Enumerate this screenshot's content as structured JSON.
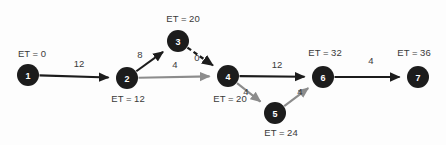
{
  "diagram": {
    "background_color": "#fdfdfd",
    "node_fill": "#1c1c1c",
    "node_text_color": "#ffffff",
    "critical_edge_color": "#1c1c1c",
    "noncritical_edge_color": "#8c8c8c",
    "label_color": "#3a3a3a",
    "node_radius": 11
  },
  "nodes": [
    {
      "id": "1",
      "label": "1",
      "cx": 28,
      "cy": 75,
      "et_text": "ET = 0",
      "et_x": 32,
      "et_y": 53
    },
    {
      "id": "2",
      "label": "2",
      "cx": 127,
      "cy": 78,
      "et_text": "ET = 12",
      "et_x": 128,
      "et_y": 98
    },
    {
      "id": "3",
      "label": "3",
      "cx": 178,
      "cy": 41,
      "et_text": "ET = 20",
      "et_x": 183,
      "et_y": 18
    },
    {
      "id": "4",
      "label": "4",
      "cx": 228,
      "cy": 76,
      "et_text": "ET = 20",
      "et_x": 230,
      "et_y": 98
    },
    {
      "id": "5",
      "label": "5",
      "cx": 275,
      "cy": 113,
      "et_text": "ET = 24",
      "et_x": 281,
      "et_y": 132
    },
    {
      "id": "6",
      "label": "6",
      "cx": 323,
      "cy": 77,
      "et_text": "ET = 32",
      "et_x": 325,
      "et_y": 52
    },
    {
      "id": "7",
      "label": "7",
      "cx": 418,
      "cy": 77,
      "et_text": "ET = 36",
      "et_x": 414,
      "et_y": 52
    }
  ],
  "edges": [
    {
      "id": "e1-2",
      "from": "1",
      "to": "2",
      "weight": "12",
      "style": "solid",
      "color": "critical",
      "label_x": 79,
      "label_y": 63
    },
    {
      "id": "e2-3",
      "from": "2",
      "to": "3",
      "weight": "8",
      "style": "solid",
      "color": "critical",
      "label_x": 140,
      "label_y": 54
    },
    {
      "id": "e3-4",
      "from": "3",
      "to": "4",
      "weight": "0",
      "style": "dashed",
      "color": "critical",
      "label_x": 197,
      "label_y": 57
    },
    {
      "id": "e2-4",
      "from": "2",
      "to": "4",
      "weight": "4",
      "style": "solid",
      "color": "noncritical",
      "label_x": 175,
      "label_y": 64
    },
    {
      "id": "e4-6",
      "from": "4",
      "to": "6",
      "weight": "12",
      "style": "solid",
      "color": "critical",
      "label_x": 277,
      "label_y": 64
    },
    {
      "id": "e4-5",
      "from": "4",
      "to": "5",
      "weight": "4",
      "style": "solid",
      "color": "noncritical",
      "label_x": 246,
      "label_y": 91
    },
    {
      "id": "e5-6",
      "from": "5",
      "to": "6",
      "weight": "4",
      "style": "solid",
      "color": "noncritical",
      "label_x": 300,
      "label_y": 91
    },
    {
      "id": "e6-7",
      "from": "6",
      "to": "7",
      "weight": "4",
      "style": "solid",
      "color": "critical",
      "label_x": 371,
      "label_y": 60
    }
  ],
  "chart_data": {
    "type": "diagram",
    "subtype": "activity-on-arrow-network",
    "nodes": [
      {
        "id": "1",
        "earliest_time": 0
      },
      {
        "id": "2",
        "earliest_time": 12
      },
      {
        "id": "3",
        "earliest_time": 20
      },
      {
        "id": "4",
        "earliest_time": 20
      },
      {
        "id": "5",
        "earliest_time": 24
      },
      {
        "id": "6",
        "earliest_time": 32
      },
      {
        "id": "7",
        "earliest_time": 36
      }
    ],
    "edges": [
      {
        "from": "1",
        "to": "2",
        "duration": 12,
        "dashed": false,
        "on_critical_path": true
      },
      {
        "from": "2",
        "to": "3",
        "duration": 8,
        "dashed": false,
        "on_critical_path": true
      },
      {
        "from": "3",
        "to": "4",
        "duration": 0,
        "dashed": true,
        "on_critical_path": true
      },
      {
        "from": "2",
        "to": "4",
        "duration": 4,
        "dashed": false,
        "on_critical_path": false
      },
      {
        "from": "4",
        "to": "6",
        "duration": 12,
        "dashed": false,
        "on_critical_path": true
      },
      {
        "from": "4",
        "to": "5",
        "duration": 4,
        "dashed": false,
        "on_critical_path": false
      },
      {
        "from": "5",
        "to": "6",
        "duration": 4,
        "dashed": false,
        "on_critical_path": false
      },
      {
        "from": "6",
        "to": "7",
        "duration": 4,
        "dashed": false,
        "on_critical_path": true
      }
    ],
    "critical_path": [
      "1",
      "2",
      "3",
      "4",
      "6",
      "7"
    ],
    "project_duration": 36
  }
}
